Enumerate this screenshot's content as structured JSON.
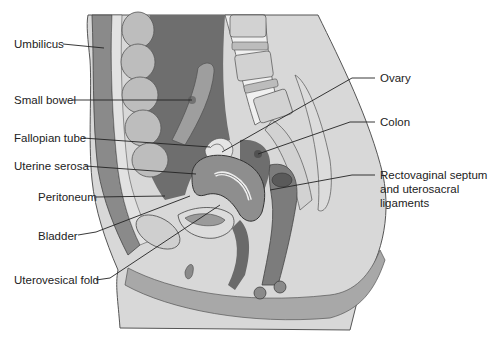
{
  "figure": {
    "type": "anatomical sagittal section",
    "colors": {
      "background": "#ffffff",
      "body_outline": "#d9d9d9",
      "abdominal_wall": "#9a9a9a",
      "cavity_dark": "#6e6e6e",
      "organ_mid": "#8c8c8c",
      "organ_light": "#c4c4c4",
      "bone": "#d0d0d0",
      "line": "#333333"
    }
  },
  "labels": {
    "left": [
      {
        "text": "Umbilicus"
      },
      {
        "text": "Small bowel"
      },
      {
        "text": "Fallopian tube"
      },
      {
        "text": "Uterine serosa"
      },
      {
        "text": "Peritoneum"
      },
      {
        "text": "Bladder"
      },
      {
        "text": "Uterovesical fold"
      }
    ],
    "right": [
      {
        "text": "Ovary"
      },
      {
        "text": "Colon"
      },
      {
        "text": "Rectovaginal septum and uterosacral ligaments"
      }
    ]
  }
}
